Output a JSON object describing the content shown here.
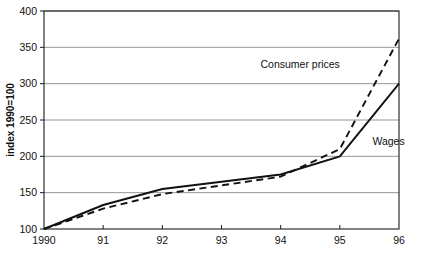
{
  "chart_data": {
    "type": "line",
    "title": "",
    "xlabel": "",
    "ylabel": "index 1990=100",
    "x": [
      1990,
      1991,
      1992,
      1993,
      1994,
      1995,
      1996
    ],
    "xtick_labels": [
      "1990",
      "91",
      "92",
      "93",
      "94",
      "95",
      "96"
    ],
    "ytick_labels": [
      "100",
      "150",
      "200",
      "250",
      "300",
      "350",
      "400"
    ],
    "yticks": [
      100,
      150,
      200,
      250,
      300,
      350,
      400
    ],
    "ylim": [
      100,
      400
    ],
    "xlim": [
      1990,
      1996
    ],
    "grid": true,
    "legend_position": "inline-annotation",
    "series": [
      {
        "name": "Consumer prices",
        "style": "dashed",
        "color": "#111111",
        "values": [
          100,
          128,
          148,
          160,
          172,
          210,
          362
        ],
        "label_x": 1995.0,
        "label_y": 322
      },
      {
        "name": "Wages",
        "style": "solid",
        "color": "#111111",
        "values": [
          100,
          133,
          155,
          165,
          175,
          200,
          300
        ],
        "label_x": 1995.55,
        "label_y": 216
      }
    ]
  },
  "axes": {
    "y_title": "index 1990=100",
    "y_ticks": [
      {
        "value": 400,
        "label": "400"
      },
      {
        "value": 350,
        "label": "350"
      },
      {
        "value": 300,
        "label": "300"
      },
      {
        "value": 250,
        "label": "250"
      },
      {
        "value": 200,
        "label": "200"
      },
      {
        "value": 150,
        "label": "150"
      },
      {
        "value": 100,
        "label": "100"
      }
    ],
    "x_ticks": [
      {
        "value": 1990,
        "label": "1990"
      },
      {
        "value": 1991,
        "label": "91"
      },
      {
        "value": 1992,
        "label": "92"
      },
      {
        "value": 1993,
        "label": "93"
      },
      {
        "value": 1994,
        "label": "94"
      },
      {
        "value": 1995,
        "label": "95"
      },
      {
        "value": 1996,
        "label": "96"
      }
    ]
  },
  "annotations": [
    {
      "name": "consumer-prices-label",
      "text": "Consumer prices"
    },
    {
      "name": "wages-label",
      "text": "Wages"
    }
  ]
}
